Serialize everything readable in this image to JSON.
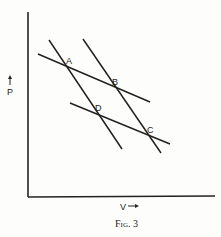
{
  "figure": {
    "caption": "Fig. 3",
    "x_axis_label": "V",
    "y_axis_label": "P",
    "points": [
      {
        "label": "A"
      },
      {
        "label": "B"
      },
      {
        "label": "C"
      },
      {
        "label": "D"
      }
    ],
    "colors": {
      "ink": "#222222",
      "paper": "#fdfdfb"
    }
  }
}
